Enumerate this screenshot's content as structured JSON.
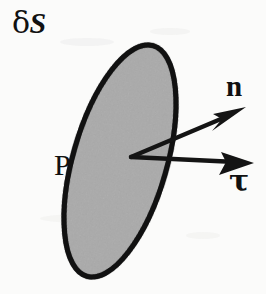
{
  "figure": {
    "name": "surface-element-normal-tangent-diagram",
    "background_color": "#fbfbfa",
    "ink_color": "#111111",
    "surface_fill_color": "#a9a9a9",
    "surface_stroke_color": "#111111",
    "labels": {
      "surface_element": "δS",
      "surface_element_delta": "δ",
      "surface_element_S": "S",
      "point": "P",
      "normal_vector": "n",
      "tangent_vector": "τ"
    },
    "geometry": {
      "ellipse": {
        "center_x": 120,
        "center_y": 161,
        "radius_x": 47,
        "radius_y": 120,
        "rotation_deg": 16,
        "stroke_width": 5
      },
      "origin_point": {
        "x": 131,
        "y": 157
      },
      "normal_arrow": {
        "from_x": 131,
        "from_y": 157,
        "to_x": 245,
        "to_y": 108,
        "stroke_width": 4.5
      },
      "tangent_arrow": {
        "from_x": 131,
        "from_y": 157,
        "to_x": 253,
        "to_y": 163,
        "stroke_width": 4.5
      }
    }
  }
}
